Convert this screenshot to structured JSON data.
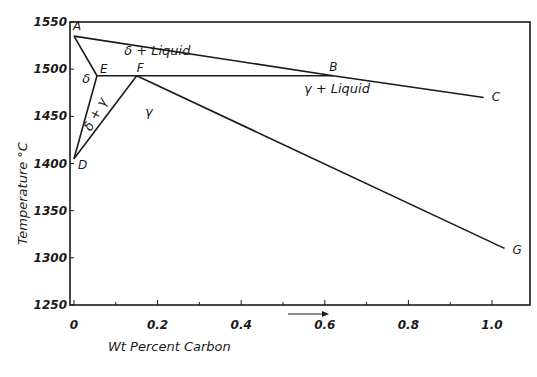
{
  "chart_data": {
    "type": "line",
    "title": "",
    "xlabel": "Wt Percent  Carbon",
    "ylabel": "Temperature °C",
    "xlim": [
      0,
      1.08
    ],
    "ylim": [
      1250,
      1550
    ],
    "x_ticks": [
      "0",
      "0.2",
      "0.4",
      "0.6",
      "0.8",
      "1.0"
    ],
    "x_tick_values": [
      0,
      0.2,
      0.4,
      0.6,
      0.8,
      1.0
    ],
    "y_ticks": [
      "1550",
      "1500",
      "1450",
      "1400",
      "1350",
      "1300",
      "1250"
    ],
    "y_tick_values": [
      1550,
      1500,
      1450,
      1400,
      1350,
      1300,
      1250
    ],
    "grid": false,
    "points": [
      {
        "label": "A",
        "x": 0.0,
        "y": 1535
      },
      {
        "label": "E",
        "x": 0.055,
        "y": 1493
      },
      {
        "label": "F",
        "x": 0.15,
        "y": 1493
      },
      {
        "label": "B",
        "x": 0.62,
        "y": 1493
      },
      {
        "label": "C",
        "x": 0.98,
        "y": 1470
      },
      {
        "label": "D",
        "x": 0.0,
        "y": 1405
      },
      {
        "label": "G",
        "x": 1.03,
        "y": 1310
      }
    ],
    "series": [
      {
        "name": "Liquidus A-B-C",
        "x": [
          0.0,
          0.62,
          0.98
        ],
        "y": [
          1535,
          1493,
          1470
        ]
      },
      {
        "name": "delta solidus A-E",
        "x": [
          0.0,
          0.055
        ],
        "y": [
          1535,
          1493
        ]
      },
      {
        "name": "Peritectic line E-B",
        "x": [
          0.055,
          0.62
        ],
        "y": [
          1493,
          1493
        ]
      },
      {
        "name": "Solidus F-G",
        "x": [
          0.15,
          1.03
        ],
        "y": [
          1493,
          1310
        ]
      },
      {
        "name": "D-E boundary",
        "x": [
          0.0,
          0.055
        ],
        "y": [
          1405,
          1493
        ]
      },
      {
        "name": "D-F boundary",
        "x": [
          0.0,
          0.15
        ],
        "y": [
          1405,
          1493
        ]
      }
    ],
    "regions": [
      {
        "label": "δ + Liquid",
        "x": 0.12,
        "y": 1515
      },
      {
        "label": "δ",
        "x": 0.02,
        "y": 1485
      },
      {
        "label": "δ + γ",
        "x": 0.06,
        "y": 1450
      },
      {
        "label": "γ",
        "x": 0.17,
        "y": 1450
      },
      {
        "label": "γ + Liquid",
        "x": 0.55,
        "y": 1475
      }
    ],
    "annotations": [
      "arrow under x-axis pointing right between 0.5 and 0.6"
    ]
  },
  "layout": {
    "plot": {
      "left": 70,
      "right": 530,
      "top": 22,
      "bottom": 305
    },
    "x_px": {
      "0": 74,
      "1.0": 492
    },
    "y_px": {
      "1550": 22,
      "1250": 305
    }
  },
  "colors": {
    "ink": "#1a1a1a",
    "background": "#ffffff"
  }
}
